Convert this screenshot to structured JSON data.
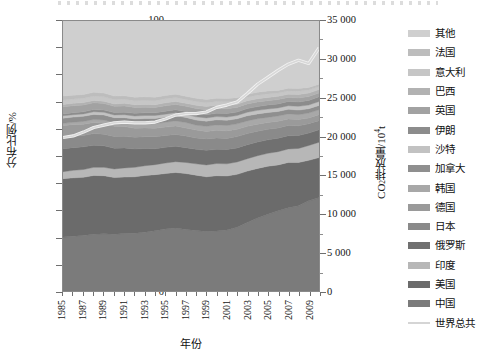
{
  "axes": {
    "left": {
      "label": "分布比例/%",
      "ticks": [
        "0",
        "10",
        "20",
        "30",
        "40",
        "50",
        "60",
        "70",
        "80",
        "90",
        "100"
      ],
      "min": 0,
      "max": 100
    },
    "right": {
      "label_prefix": "CO",
      "label_sub": "2",
      "label_mid": "排放量/10",
      "label_sup": "4",
      "label_suffix": "t",
      "ticks": [
        "0",
        "5 000",
        "10 000",
        "15 000",
        "20 000",
        "25 000",
        "30 000",
        "35 000"
      ],
      "min": 0,
      "max": 35000
    },
    "bottom": {
      "label": "年份",
      "ticks": [
        "1985",
        "1987",
        "1989",
        "1991",
        "1993",
        "1995",
        "1997",
        "1999",
        "2001",
        "2003",
        "2005",
        "2007",
        "2009"
      ]
    }
  },
  "legend": {
    "items": [
      {
        "label": "其他",
        "color": "#cfcfcf",
        "type": "area"
      },
      {
        "label": "法国",
        "color": "#bdbdbd",
        "type": "area"
      },
      {
        "label": "意大利",
        "color": "#c6c6c6",
        "type": "area"
      },
      {
        "label": "巴西",
        "color": "#b2b2b2",
        "type": "area"
      },
      {
        "label": "英国",
        "color": "#a2a2a2",
        "type": "area"
      },
      {
        "label": "伊朗",
        "color": "#8c8c8c",
        "type": "area"
      },
      {
        "label": "沙特",
        "color": "#c2c2c2",
        "type": "area"
      },
      {
        "label": "加拿大",
        "color": "#8f8f8f",
        "type": "area"
      },
      {
        "label": "韩国",
        "color": "#a8a8a8",
        "type": "area"
      },
      {
        "label": "德国",
        "color": "#9a9a9a",
        "type": "area"
      },
      {
        "label": "日本",
        "color": "#8a8a8a",
        "type": "area"
      },
      {
        "label": "俄罗斯",
        "color": "#707070",
        "type": "area"
      },
      {
        "label": "印度",
        "color": "#b7b7b7",
        "type": "area"
      },
      {
        "label": "美国",
        "color": "#6b6b6b",
        "type": "area"
      },
      {
        "label": "中国",
        "color": "#7b7b7b",
        "type": "area"
      },
      {
        "label": "世界总共",
        "color": "#d5d5d5",
        "type": "line"
      }
    ]
  },
  "chart_data": {
    "type": "area",
    "title": "",
    "subtitle": "",
    "xlabel": "年份",
    "ylabel": "分布比例/%",
    "y2label": "CO2排放量/10^4 t",
    "xlim": [
      1985,
      2010
    ],
    "ylim": [
      0,
      100
    ],
    "y2lim": [
      0,
      35000
    ],
    "grid": false,
    "legend_position": "right",
    "stack_order_bottom_to_top": [
      "中国",
      "美国",
      "印度",
      "俄罗斯",
      "日本",
      "德国",
      "韩国",
      "加拿大",
      "沙特",
      "伊朗",
      "英国",
      "巴西",
      "意大利",
      "法国",
      "其他"
    ],
    "x": [
      1985,
      1986,
      1987,
      1988,
      1989,
      1990,
      1991,
      1992,
      1993,
      1994,
      1995,
      1996,
      1997,
      1998,
      1999,
      2000,
      2001,
      2002,
      2003,
      2004,
      2005,
      2006,
      2007,
      2008,
      2009,
      2010
    ],
    "series": [
      {
        "name": "中国",
        "values": [
          20.0,
          20.3,
          20.6,
          21.0,
          21.2,
          21.0,
          21.3,
          21.4,
          21.8,
          22.3,
          23.0,
          23.3,
          22.8,
          22.4,
          22.0,
          22.2,
          22.6,
          23.6,
          25.4,
          27.0,
          28.4,
          29.7,
          30.8,
          31.6,
          33.4,
          34.6
        ]
      },
      {
        "name": "美国",
        "values": [
          21.6,
          21.6,
          21.5,
          21.8,
          21.5,
          21.0,
          20.9,
          20.9,
          21.0,
          20.8,
          20.5,
          20.6,
          20.7,
          20.5,
          20.3,
          20.5,
          20.0,
          19.6,
          19.0,
          18.4,
          17.8,
          17.0,
          16.8,
          16.0,
          15.0,
          14.8
        ]
      },
      {
        "name": "印度",
        "values": [
          2.6,
          2.8,
          2.9,
          3.0,
          3.1,
          3.2,
          3.4,
          3.5,
          3.6,
          3.7,
          3.9,
          4.0,
          4.1,
          4.2,
          4.4,
          4.5,
          4.5,
          4.6,
          4.6,
          4.7,
          4.8,
          4.9,
          5.0,
          5.2,
          5.5,
          5.7
        ]
      },
      {
        "name": "俄罗斯",
        "values": [
          8.5,
          8.4,
          8.4,
          8.2,
          8.0,
          7.7,
          7.4,
          6.8,
          6.4,
          5.9,
          5.8,
          5.7,
          5.5,
          5.4,
          5.4,
          5.3,
          5.3,
          5.2,
          5.2,
          5.1,
          5.0,
          5.0,
          4.9,
          4.8,
          4.6,
          4.6
        ]
      },
      {
        "name": "日本",
        "values": [
          4.2,
          4.2,
          4.2,
          4.3,
          4.3,
          4.3,
          4.3,
          4.3,
          4.3,
          4.4,
          4.4,
          4.4,
          4.3,
          4.2,
          4.2,
          4.2,
          4.1,
          4.2,
          4.1,
          4.0,
          3.9,
          3.8,
          3.8,
          3.6,
          3.4,
          3.4
        ]
      },
      {
        "name": "德国",
        "values": [
          4.4,
          4.3,
          4.2,
          4.1,
          4.0,
          3.8,
          3.6,
          3.4,
          3.3,
          3.2,
          3.1,
          3.1,
          3.0,
          2.9,
          2.8,
          2.8,
          2.8,
          2.7,
          2.7,
          2.6,
          2.5,
          2.5,
          2.4,
          2.3,
          2.2,
          2.2
        ]
      },
      {
        "name": "韩国",
        "values": [
          0.8,
          0.9,
          1.0,
          1.1,
          1.2,
          1.3,
          1.4,
          1.5,
          1.6,
          1.7,
          1.8,
          1.9,
          2.0,
          1.8,
          1.9,
          2.0,
          2.0,
          2.0,
          2.0,
          2.0,
          1.9,
          1.9,
          1.9,
          1.8,
          1.8,
          1.8
        ]
      },
      {
        "name": "加拿大",
        "values": [
          1.9,
          1.9,
          1.9,
          1.9,
          1.9,
          1.9,
          1.9,
          1.9,
          1.9,
          1.9,
          1.9,
          1.9,
          1.9,
          1.9,
          1.9,
          1.9,
          1.9,
          1.9,
          1.9,
          1.8,
          1.8,
          1.7,
          1.7,
          1.7,
          1.6,
          1.6
        ]
      },
      {
        "name": "沙特",
        "values": [
          0.9,
          0.9,
          0.9,
          1.0,
          1.0,
          1.0,
          1.1,
          1.1,
          1.1,
          1.1,
          1.1,
          1.1,
          1.1,
          1.2,
          1.2,
          1.2,
          1.2,
          1.2,
          1.3,
          1.3,
          1.3,
          1.3,
          1.3,
          1.4,
          1.4,
          1.5
        ]
      },
      {
        "name": "伊朗",
        "values": [
          0.7,
          0.7,
          0.8,
          0.8,
          0.8,
          0.9,
          0.9,
          1.0,
          1.0,
          1.0,
          1.1,
          1.1,
          1.1,
          1.2,
          1.2,
          1.2,
          1.3,
          1.3,
          1.4,
          1.4,
          1.5,
          1.5,
          1.6,
          1.6,
          1.7,
          1.7
        ]
      },
      {
        "name": "英国",
        "values": [
          2.6,
          2.6,
          2.5,
          2.5,
          2.4,
          2.3,
          2.3,
          2.2,
          2.1,
          2.0,
          2.0,
          2.0,
          1.9,
          1.9,
          1.8,
          1.8,
          1.8,
          1.7,
          1.7,
          1.7,
          1.6,
          1.6,
          1.5,
          1.5,
          1.4,
          1.4
        ]
      },
      {
        "name": "巴西",
        "values": [
          0.9,
          0.9,
          0.9,
          0.9,
          0.9,
          0.9,
          1.0,
          1.0,
          1.0,
          1.0,
          1.1,
          1.1,
          1.1,
          1.2,
          1.2,
          1.2,
          1.2,
          1.2,
          1.2,
          1.2,
          1.2,
          1.2,
          1.2,
          1.3,
          1.3,
          1.3
        ]
      },
      {
        "name": "意大利",
        "values": [
          1.6,
          1.6,
          1.6,
          1.6,
          1.6,
          1.6,
          1.5,
          1.5,
          1.5,
          1.5,
          1.5,
          1.5,
          1.4,
          1.4,
          1.4,
          1.4,
          1.4,
          1.3,
          1.3,
          1.3,
          1.3,
          1.2,
          1.2,
          1.2,
          1.1,
          1.1
        ]
      },
      {
        "name": "法国",
        "values": [
          1.5,
          1.4,
          1.4,
          1.4,
          1.4,
          1.3,
          1.3,
          1.3,
          1.3,
          1.3,
          1.2,
          1.2,
          1.2,
          1.2,
          1.2,
          1.2,
          1.2,
          1.1,
          1.1,
          1.1,
          1.1,
          1.0,
          1.0,
          1.0,
          1.0,
          0.9
        ]
      },
      {
        "name": "其他",
        "values": [
          27.8,
          27.5,
          27.2,
          26.4,
          26.7,
          27.8,
          27.7,
          28.2,
          28.1,
          28.2,
          27.6,
          27.1,
          27.9,
          28.6,
          29.1,
          28.6,
          28.7,
          28.4,
          27.1,
          26.4,
          25.9,
          25.7,
          24.9,
          25.0,
          25.6,
          23.4
        ]
      }
    ],
    "overlay_line": {
      "name": "世界总共",
      "axis": "right",
      "units": "10^4 t",
      "values": [
        19900,
        20100,
        20600,
        21200,
        21500,
        21800,
        21900,
        21800,
        21800,
        21900,
        22300,
        22800,
        23000,
        23000,
        23200,
        23800,
        24100,
        24500,
        25600,
        26800,
        27700,
        28600,
        29400,
        29900,
        29500,
        31500
      ]
    }
  }
}
